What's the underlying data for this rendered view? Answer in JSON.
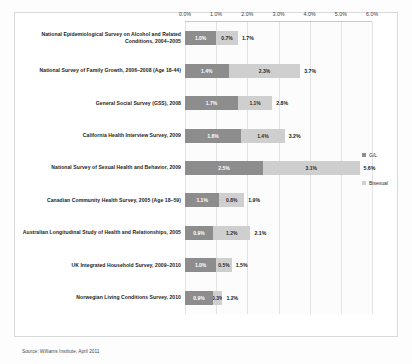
{
  "chart_data": {
    "type": "bar",
    "subtype": "stacked-horizontal-bar",
    "title": "",
    "xlabel": "",
    "ylabel": "",
    "xlim": [
      0,
      6
    ],
    "xticks": [
      "0.0%",
      "1.0%",
      "2.0%",
      "3.0%",
      "4.0%",
      "5.0%",
      "6.0%"
    ],
    "xtick_values": [
      0,
      1,
      2,
      3,
      4,
      5,
      6
    ],
    "grid": true,
    "legend_position": "right",
    "categories": [
      "National Epidemiological Survey on Alcohol and Related Conditions, 2004–2005",
      "National Survey of Family Growth, 2006–2008 (Age 18-44)",
      "General Social Survey (GSS), 2008",
      "California Health Interview Survey, 2009",
      "National Survey of Sexual Health and Behavior, 2009",
      "Canadian Community Health Survey, 2005 (Age 18–59)",
      "Australian Longitudinal Study of Health and Relationships, 2005",
      "UK Integrated Household Survey, 2009–2010",
      "Norwegian Living Conditions Survey, 2010"
    ],
    "series": [
      {
        "name": "G/L",
        "color": "#8d8d8d",
        "values": [
          1.0,
          1.4,
          1.7,
          1.8,
          2.5,
          1.1,
          0.9,
          1.0,
          0.9
        ],
        "labels": [
          "1.0%",
          "1.4%",
          "1.7%",
          "1.8%",
          "2.5%",
          "1.1%",
          "0.9%",
          "1.0%",
          "0.9%"
        ]
      },
      {
        "name": "Bisexual",
        "color": "#cfcfcf",
        "values": [
          0.7,
          2.3,
          1.1,
          1.4,
          3.1,
          0.8,
          1.2,
          0.5,
          0.3
        ],
        "labels": [
          "0.7%",
          "2.3%",
          "1.1%",
          "1.4%",
          "3.1%",
          "0.8%",
          "1.2%",
          "0.5%",
          "0.3%"
        ]
      }
    ],
    "totals": [
      1.7,
      3.7,
      2.8,
      3.2,
      5.6,
      1.9,
      2.1,
      1.5,
      1.2
    ],
    "total_labels": [
      "1.7%",
      "3.7%",
      "2.8%",
      "3.2%",
      "5.6%",
      "1.9%",
      "2.1%",
      "1.5%",
      "1.2%"
    ],
    "legend": [
      {
        "label": "G/L",
        "color": "#8d8d8d"
      },
      {
        "label": "Bisexual",
        "color": "#cfcfcf"
      }
    ],
    "source": "Source: Williams Institute, April 2011"
  }
}
